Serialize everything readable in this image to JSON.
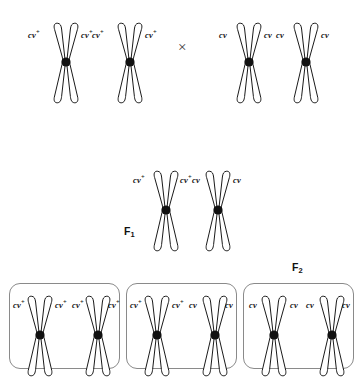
{
  "figure": {
    "cross_symbol": "×",
    "allele_wildtype": "cv",
    "allele_wildtype_sup": "+",
    "allele_mutant": "cv",
    "generations": {
      "f1_label": "F",
      "f1_sub": "1",
      "f2_label": "F",
      "f2_sub": "2"
    }
  },
  "parental": {
    "left_parent": {
      "name": "homozygous wild-type parent",
      "chromosomes": [
        {
          "left_label": "cv",
          "left_sup": "+",
          "right_label": "cv",
          "right_sup": "+"
        },
        {
          "left_label": "cv",
          "left_sup": "+",
          "right_label": "cv",
          "right_sup": "+"
        }
      ]
    },
    "right_parent": {
      "name": "homozygous mutant parent",
      "chromosomes": [
        {
          "left_label": "cv",
          "left_sup": "",
          "right_label": "cv",
          "right_sup": ""
        },
        {
          "left_label": "cv",
          "left_sup": "",
          "right_label": "cv",
          "right_sup": ""
        }
      ]
    }
  },
  "f1": {
    "name": "heterozygous F1 offspring",
    "chromosomes": [
      {
        "left_label": "cv",
        "left_sup": "+",
        "right_label": "cv",
        "right_sup": "+"
      },
      {
        "left_label": "cv",
        "left_sup": "",
        "right_label": "cv",
        "right_sup": ""
      }
    ]
  },
  "f2": {
    "name": "F2 offspring genotype classes",
    "boxes": [
      {
        "genotype": "homozygous wild-type",
        "chromosomes": [
          {
            "left_label": "cv",
            "left_sup": "+",
            "right_label": "cv",
            "right_sup": "+"
          },
          {
            "left_label": "cv",
            "left_sup": "+",
            "right_label": "cv",
            "right_sup": "+"
          }
        ]
      },
      {
        "genotype": "heterozygous",
        "chromosomes": [
          {
            "left_label": "cv",
            "left_sup": "+",
            "right_label": "cv",
            "right_sup": "+"
          },
          {
            "left_label": "cv",
            "left_sup": "",
            "right_label": "cv",
            "right_sup": ""
          }
        ]
      },
      {
        "genotype": "homozygous mutant",
        "chromosomes": [
          {
            "left_label": "cv",
            "left_sup": "",
            "right_label": "cv",
            "right_sup": ""
          },
          {
            "left_label": "cv",
            "left_sup": "",
            "right_label": "cv",
            "right_sup": ""
          }
        ]
      }
    ]
  }
}
